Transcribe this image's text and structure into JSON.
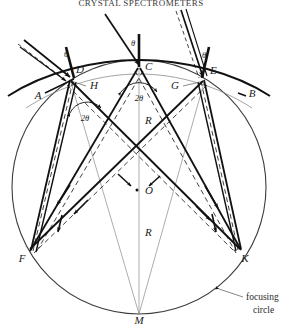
{
  "figure": {
    "title": "CRYSTAL SPECTROMETERS",
    "caption_note": "focusing circle",
    "annotation": {
      "line1": "focusing",
      "line2": "circle"
    },
    "labels": {
      "A": "A",
      "B": "B",
      "C": "C",
      "D": "D",
      "E": "E",
      "F": "F",
      "G": "G",
      "H": "H",
      "K": "K",
      "M": "M",
      "O": "O",
      "R_upper": "R",
      "R_lower": "R",
      "theta_left": "θ",
      "theta_center": "θ",
      "theta_right": "θ",
      "two_theta_center": "2θ",
      "two_theta_left": "2θ"
    },
    "colors": {
      "stroke_main": "#1a1a1a",
      "stroke_thin": "#6a6a6a",
      "stroke_dashed": "#1a1a1a",
      "background": "#ffffff"
    },
    "geometry": {
      "focusing_circle": {
        "cx": 139,
        "cy": 187,
        "r": 127
      },
      "crystal_arc_center": {
        "cx": 139,
        "cy": 320,
        "r": 253
      },
      "points": {
        "C": {
          "x": 139,
          "y": 67
        },
        "D": {
          "x": 70,
          "y": 79
        },
        "E": {
          "x": 205,
          "y": 79
        },
        "F": {
          "x": 29,
          "y": 250
        },
        "K": {
          "x": 240,
          "y": 250
        },
        "M": {
          "x": 139,
          "y": 314
        },
        "O": {
          "x": 139,
          "y": 187
        },
        "H": {
          "x": 80,
          "y": 84
        },
        "G": {
          "x": 192,
          "y": 84
        }
      }
    }
  }
}
